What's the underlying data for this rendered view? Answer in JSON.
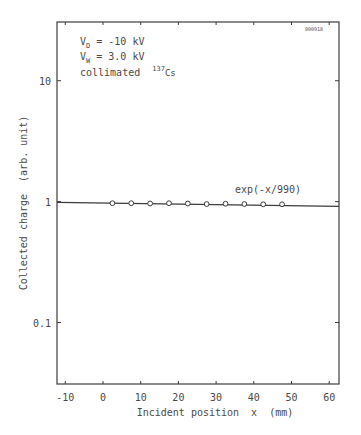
{
  "chart_data": {
    "type": "scatter",
    "title": "",
    "id_stamp": "800918",
    "xlabel": "Incident position  x  (mm)",
    "ylabel": "Collected charge  (arb. unit)",
    "xscale": "linear",
    "yscale": "log",
    "xlim": [
      -12.2,
      62.6
    ],
    "ylim": [
      0.031,
      30.6
    ],
    "xticks": [
      -10,
      0,
      10,
      20,
      30,
      40,
      50,
      60
    ],
    "xtick_labels": [
      "-10",
      "0",
      "10",
      "20",
      "30",
      "40",
      "50",
      "60"
    ],
    "yticks": [
      0.1,
      1,
      10
    ],
    "ytick_labels": [
      "0.1",
      "1",
      "10"
    ],
    "grid": false,
    "annotations": [
      {
        "text_main": "V",
        "sub": "D",
        "rest": " = -10 kV"
      },
      {
        "text_main": "V",
        "sub": "W",
        "rest": " = 3.0 kV"
      },
      {
        "text_main": "collimated ",
        "sup": "137",
        "rest": "Cs"
      }
    ],
    "fit_label": "exp(-x/990)",
    "series": [
      {
        "name": "measured",
        "marker": "open-circle",
        "x": [
          2.5,
          7.5,
          12.5,
          17.5,
          22.5,
          27.5,
          32.5,
          37.5,
          42.5,
          47.5
        ],
        "y": [
          0.97,
          0.97,
          0.965,
          0.97,
          0.965,
          0.955,
          0.96,
          0.955,
          0.95,
          0.95
        ]
      },
      {
        "name": "exp(-x/990)",
        "type": "line",
        "x": [
          -12.2,
          62.6
        ],
        "y": [
          0.985,
          0.915
        ]
      }
    ]
  }
}
